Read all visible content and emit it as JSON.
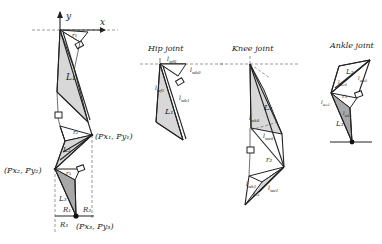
{
  "diagram": {
    "main_model": {
      "axis_labels": {
        "y": "y",
        "x": "x"
      },
      "muscle_labels": [
        "r1",
        "L1",
        "r2",
        "L2",
        "r3",
        "L3"
      ],
      "segment_labels": {
        "r1": "r₁",
        "L1": "L₁",
        "r2": "r₂",
        "L2": "L₂",
        "r3": "r₃",
        "L3": "L₃"
      },
      "points": {
        "p1": "(Px₁, Py₁)",
        "p2": "(Px₂, Py₂)",
        "p3": "(Px₃, Py₃)"
      },
      "reaction_labels": {
        "R1": "R₁",
        "R2": "R₂",
        "R3": "R₃"
      }
    },
    "hip_joint": {
      "title": "Hip joint",
      "labels": {
        "lwf0": "l_wf0",
        "lwb0": "l_wb0",
        "lwf1": "l_wf1",
        "lwb1": "l_wb1",
        "L1": "L₁"
      }
    },
    "knee_joint": {
      "title": "Knee joint",
      "labels": {
        "L2": "L₂",
        "lwk0": "l_wk0",
        "lwe0": "l_we0",
        "r2": "r₂",
        "lwk1": "l_wk1",
        "lwe1": "l_we1",
        "L3": "L₃"
      }
    },
    "ankle_joint": {
      "title": "Ankle joint",
      "labels": {
        "L2": "L₂",
        "lwa0": "l_wa0",
        "lwb0": "l_wb0",
        "r3": "r₃",
        "lwa1": "l_wa1",
        "lwb1": "l_wb1",
        "L3": "L₃"
      }
    }
  }
}
